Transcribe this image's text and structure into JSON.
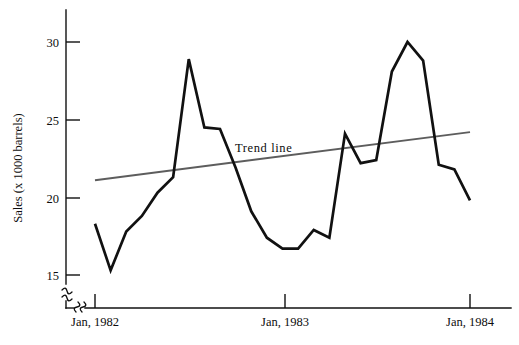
{
  "chart_data": {
    "type": "line",
    "title": "",
    "subtitle": "",
    "xlabel": "",
    "ylabel": "Sales (x 1000 barrels)",
    "grid": false,
    "legend_position": "inline-annotation",
    "x_axis": {
      "tick_labels": [
        "Jan, 1982",
        "Jan, 1983",
        "Jan, 1984"
      ],
      "tick_values": [
        0,
        12,
        24
      ],
      "xlim": [
        0,
        24
      ],
      "axis_break": true
    },
    "y_axis": {
      "tick_labels": [
        "15",
        "20",
        "25",
        "30"
      ],
      "tick_values": [
        15,
        20,
        25,
        30
      ],
      "ylim": [
        15,
        31
      ],
      "axis_break": true
    },
    "annotations": [
      {
        "text": "Trend line",
        "x": 9.3,
        "y": 23.2
      }
    ],
    "series": [
      {
        "name": "Sales",
        "type": "line",
        "color": "#111111",
        "x": [
          0,
          1,
          2,
          3,
          4,
          5,
          6,
          7,
          8,
          9,
          10,
          11,
          12,
          13,
          14,
          15,
          16,
          17,
          18,
          19,
          20,
          21,
          22,
          23,
          24
        ],
        "values": [
          18.3,
          15.3,
          17.8,
          18.8,
          20.3,
          21.3,
          28.9,
          24.5,
          24.4,
          21.9,
          19.1,
          17.4,
          16.7,
          16.7,
          17.9,
          17.4,
          24.1,
          22.2,
          22.4,
          28.1,
          30.0,
          28.8,
          22.1,
          21.8,
          19.8
        ]
      },
      {
        "name": "Trend line",
        "type": "line",
        "color": "#5d5d5d",
        "x": [
          0,
          24
        ],
        "values": [
          21.1,
          24.2
        ]
      }
    ]
  },
  "labels": {
    "y_axis_title": "Sales (x 1000 barrels)",
    "trend_annotation": "Trend line",
    "y_tick_15": "15",
    "y_tick_20": "20",
    "y_tick_25": "25",
    "y_tick_30": "30",
    "x_tick_1982": "Jan, 1982",
    "x_tick_1983": "Jan, 1983",
    "x_tick_1984": "Jan, 1984"
  }
}
